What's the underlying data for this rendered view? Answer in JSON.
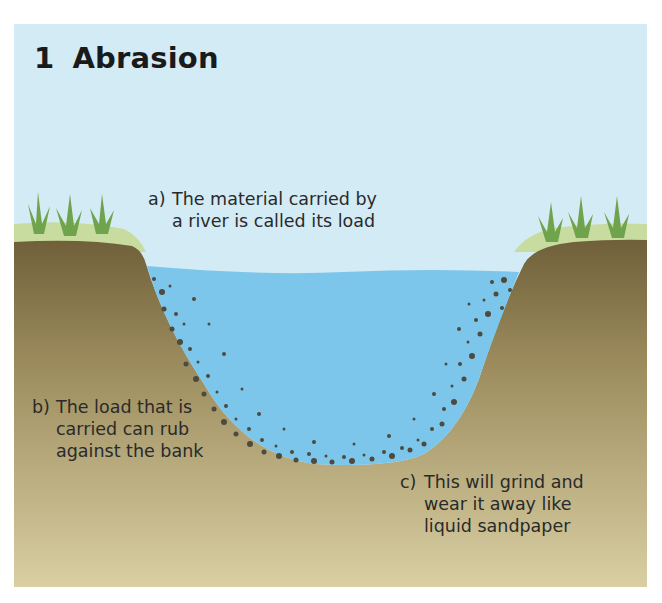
{
  "title": {
    "number": "1",
    "text": "Abrasion"
  },
  "labels": [
    {
      "marker": "a)",
      "lines": [
        "The material carried by",
        "a river is called its load"
      ]
    },
    {
      "marker": "b)",
      "lines": [
        "The load that is",
        "carried can rub",
        "against the bank"
      ]
    },
    {
      "marker": "c)",
      "lines": [
        "This will grind and",
        "wear it away like",
        "liquid sandpaper"
      ]
    }
  ],
  "colors": {
    "sky": "#d3ebf5",
    "water": "#7cc6ec",
    "ground_top": "#7a6a3e",
    "ground_bottom": "#d9cea0",
    "grass_strip": "#c8dca0",
    "grass_blade": "#6fa34c",
    "stones": "#4d4a3e"
  }
}
